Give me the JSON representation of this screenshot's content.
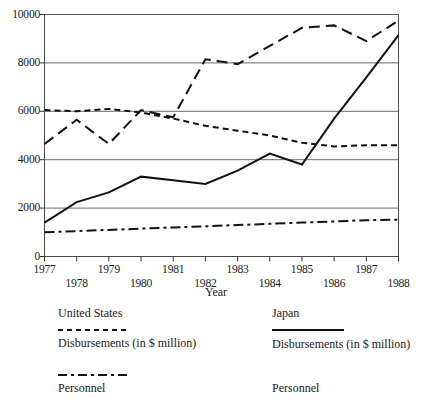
{
  "chart_data": {
    "type": "line",
    "title": "",
    "xlabel": "Year",
    "ylabel": "",
    "x": [
      1977,
      1978,
      1979,
      1980,
      1981,
      1982,
      1983,
      1984,
      1985,
      1986,
      1987,
      1988
    ],
    "xtick_labels": [
      "1977",
      "1978",
      "1979",
      "1980",
      "1981",
      "1982",
      "1983",
      "1984",
      "1985",
      "1986",
      "1987",
      "1988"
    ],
    "ytick_labels": [
      "0",
      "2000",
      "4000",
      "6000",
      "8000",
      "10000"
    ],
    "yticks": [
      0,
      2000,
      4000,
      6000,
      8000,
      10000
    ],
    "ylim": [
      0,
      10000
    ],
    "xlim": [
      1977,
      1988
    ],
    "grid": "horizontal",
    "legend_position": "below-plot",
    "series": [
      {
        "name": "Japan Personnel",
        "country": "Japan",
        "measure": "Personnel",
        "linestyle": "long-dash",
        "color": "#111111",
        "values": [
          4650,
          5650,
          4650,
          6050,
          5750,
          8150,
          7950,
          8700,
          9450,
          9550,
          8900,
          9750
        ]
      },
      {
        "name": "United States Disbursements (in $ million)",
        "country": "United States",
        "measure": "Disbursements (in $ million)",
        "linestyle": "short-dash",
        "color": "#111111",
        "values": [
          6050,
          6000,
          6100,
          5950,
          5700,
          5400,
          5200,
          5000,
          4700,
          4550,
          4600,
          4600
        ]
      },
      {
        "name": "Japan Disbursements (in $ million)",
        "country": "Japan",
        "measure": "Disbursements (in $ million)",
        "linestyle": "solid",
        "color": "#111111",
        "values": [
          1400,
          2250,
          2650,
          3300,
          3150,
          3000,
          3550,
          4250,
          3800,
          5700,
          7400,
          9150
        ]
      },
      {
        "name": "United States Personnel",
        "country": "United States",
        "measure": "Personnel",
        "linestyle": "dash-dot",
        "color": "#111111",
        "values": [
          1000,
          1050,
          1100,
          1150,
          1200,
          1250,
          1300,
          1350,
          1400,
          1450,
          1500,
          1520
        ]
      }
    ]
  },
  "axes": {
    "x_title": "Year",
    "y_ticks": [
      "10000",
      "8000",
      "6000",
      "4000",
      "2000",
      "0"
    ],
    "x_ticks_row_top": [
      "1977",
      "1979",
      "1981",
      "1983",
      "1985",
      "1987"
    ],
    "x_ticks_row_bottom": [
      "1978",
      "1980",
      "1982",
      "1984",
      "1986",
      "1988"
    ]
  },
  "legend": {
    "united_states": {
      "country_label": "United States",
      "disbursements_label": "Disbursements (in $ million)",
      "disbursements_style": "short-dash",
      "personnel_label": "Personnel",
      "personnel_style": "dash-dot"
    },
    "japan": {
      "country_label": "Japan",
      "disbursements_label": "Disbursements (in $ million)",
      "disbursements_style": "solid",
      "personnel_label": "Personnel",
      "personnel_style": "long-dash"
    }
  },
  "caption": ""
}
